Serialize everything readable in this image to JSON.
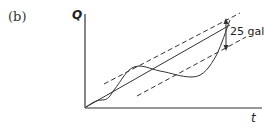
{
  "figure": {
    "panel_label": "(b)",
    "y_axis_label": "Q",
    "x_axis_label": "t",
    "annotation": "25 gal",
    "elements": [
      {
        "name": "upper-bound-line",
        "style": "dashed"
      },
      {
        "name": "mean-line",
        "style": "solid"
      },
      {
        "name": "lower-bound-line",
        "style": "dashed"
      },
      {
        "name": "cumulative-curve",
        "style": "solid"
      },
      {
        "name": "gap-arrow",
        "style": "double-headed",
        "label": "25 gal"
      }
    ]
  }
}
